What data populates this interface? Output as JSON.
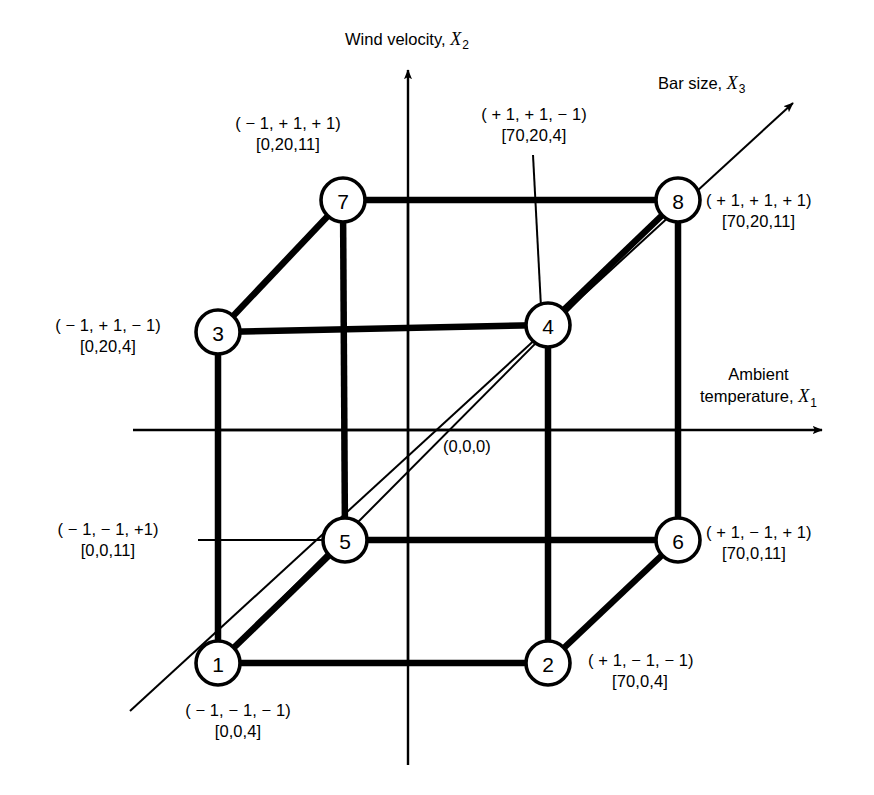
{
  "figure": {
    "type": "3d-factorial-design-cube",
    "origin_label": "(0,0,0)"
  },
  "axes": [
    {
      "id": "x2",
      "name": "Wind velocity",
      "symbol": "X",
      "subscript": "2",
      "direction": "vertical-up"
    },
    {
      "id": "x3",
      "name": "Bar size",
      "symbol": "X",
      "subscript": "3",
      "direction": "diagonal-up-right"
    },
    {
      "id": "x1",
      "name_line1": "Ambient",
      "name_line2": "temperature",
      "symbol": "X",
      "subscript": "1",
      "direction": "horizontal-right"
    }
  ],
  "vertices": [
    {
      "id": "1",
      "number": "1",
      "coded": "( − 1, − 1, − 1)",
      "natural": "[0,0,4]"
    },
    {
      "id": "2",
      "number": "2",
      "coded": "( + 1, − 1, − 1)",
      "natural": "[70,0,4]"
    },
    {
      "id": "3",
      "number": "3",
      "coded": "( − 1, + 1, − 1)",
      "natural": "[0,20,4]"
    },
    {
      "id": "4",
      "number": "4",
      "coded": "( + 1, + 1, − 1)",
      "natural": "[70,20,4]"
    },
    {
      "id": "5",
      "number": "5",
      "coded": "( − 1, − 1, +1)",
      "natural": "[0,0,11]"
    },
    {
      "id": "6",
      "number": "6",
      "coded": "( + 1, − 1, + 1)",
      "natural": "[70,0,11]"
    },
    {
      "id": "7",
      "number": "7",
      "coded": "( − 1, + 1, + 1)",
      "natural": "[0,20,11]"
    },
    {
      "id": "8",
      "number": "8",
      "coded": "( + 1, + 1, + 1)",
      "natural": "[70,20,11]"
    }
  ],
  "colors": {
    "line": "#000000",
    "background": "#ffffff"
  }
}
